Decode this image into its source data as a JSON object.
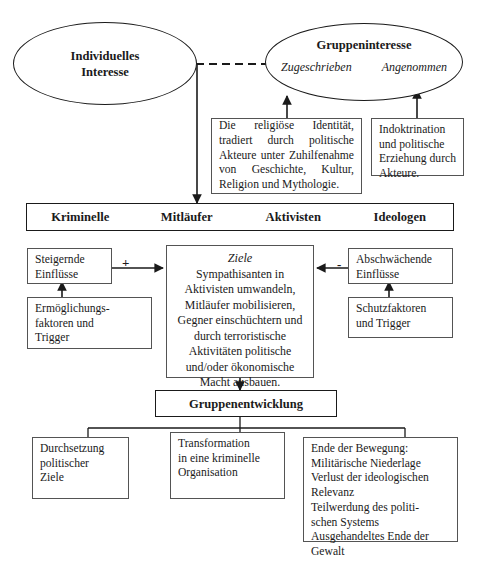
{
  "diagram": {
    "background_color": "#ffffff",
    "line_color": "#1a1a1a",
    "box_border_color": "#545454"
  },
  "nodes": {
    "individual_interest": {
      "shape": "ellipse",
      "label": "Individuelles\nInteresse",
      "line1": "Individuelles",
      "line2": "Interesse"
    },
    "group_interest": {
      "shape": "ellipse",
      "title": "Gruppeninteresse",
      "sub_left": "Zugeschrieben",
      "sub_right": "Angenommen"
    },
    "religious_identity": {
      "shape": "box",
      "text": "Die religiöse Identität, tradiert durch politische Akteure unter Zuhilfenahme von Geschichte, Kultur, Religion und Mythologie."
    },
    "indoctrination": {
      "shape": "box",
      "text": "Indoktrination und politische Erziehung durch Akteure."
    },
    "actor_types": {
      "shape": "bar",
      "items": [
        "Kriminelle",
        "Mitläufer",
        "Aktivisten",
        "Ideologen"
      ]
    },
    "increasing_influences": {
      "shape": "box",
      "text": "Steigernde\nEinflüsse",
      "line1": "Steigernde",
      "line2": "Einflüsse"
    },
    "enabling_factors": {
      "shape": "box",
      "line1": "Ermöglichungs-",
      "line2": "faktoren und",
      "line3": "Trigger"
    },
    "goals": {
      "shape": "box",
      "heading": "Ziele",
      "text": "Sympathisanten in Aktivisten umwandeln, Mitläufer mobilisieren, Gegner einschüchtern und durch terroristische Aktivitäten politische und/oder ökonomische Macht ausbauen."
    },
    "weakening_influences": {
      "shape": "box",
      "line1": "Abschwächende",
      "line2": "Einflüsse"
    },
    "protective_factors": {
      "shape": "box",
      "line1": "Schutzfaktoren",
      "line2": "und Trigger"
    },
    "group_development": {
      "shape": "box",
      "label": "Gruppenentwicklung"
    },
    "outcome_political": {
      "shape": "box",
      "line1": "Durchsetzung",
      "line2": "politischer",
      "line3": "Ziele"
    },
    "outcome_criminal": {
      "shape": "box",
      "line1": "Transformation",
      "line2": "in eine kriminelle",
      "line3": "Organisation"
    },
    "outcome_end": {
      "shape": "box",
      "line1": "Ende der Bewegung:",
      "line2": "Militärische Niederlage",
      "line3": "Verlust der ideologischen",
      "line4": "Relevanz",
      "line5": "Teilwerdung des politi-",
      "line6": "schen Systems",
      "line7": "Ausgehandeltes Ende der",
      "line8": "Gewalt"
    }
  },
  "edge_labels": {
    "positive": "+",
    "negative": "-"
  }
}
